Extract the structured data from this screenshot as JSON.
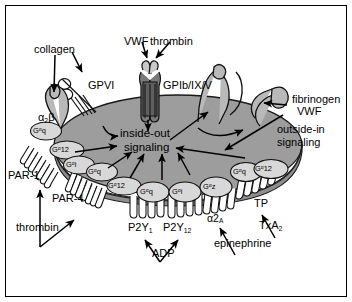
{
  "figure": {
    "type": "biological-schematic",
    "frame_color": "#000000",
    "cell_fill": "#9d9d9d",
    "cell_stroke": "#1a1a1a",
    "receptor_fill": "#c9c9c9",
    "gprotein_fill": "#d8d8d8",
    "background": "#ffffff"
  },
  "center": {
    "line1": "inside-out",
    "line2": "signaling"
  },
  "outside_in": {
    "line1": "outside-in",
    "line2": "signaling"
  },
  "receptors": {
    "gpvi": "GPVI",
    "gpib": "GPIb/IX/V",
    "par1": "PAR-1",
    "par4": "PAR-4",
    "p2y1_base": "P2Y",
    "p2y1_sub": "1",
    "p2y12_base": "P2Y",
    "p2y12_sub": "12",
    "alpha2a_base": "α2",
    "alpha2a_sub": "A",
    "tp": "TP",
    "integrin_collagen_base": "α",
    "integrin_collagen_sub": "2",
    "integrin_collagen_tail": "β"
  },
  "ligands": {
    "collagen": "collagen",
    "vwf_top": "VWF",
    "thrombin_top": "thrombin",
    "thrombin_left": "thrombin",
    "fibrinogen": "fibrinogen",
    "vwf_right": "VWF",
    "adp": "ADP",
    "epinephrine": "epinephrine",
    "txa2_base": "TxA",
    "txa2_sub": "2"
  },
  "g_proteins": [
    {
      "id": "g-par1-q",
      "sup": "α",
      "pre": "G",
      "post": "q",
      "x": 33,
      "y": 126
    },
    {
      "id": "g-par1-12",
      "sup": "α",
      "pre": "G",
      "post": "12",
      "x": 52,
      "y": 145
    },
    {
      "id": "g-par1-i",
      "sup": "α",
      "pre": "G",
      "post": "i",
      "x": 66,
      "y": 160
    },
    {
      "id": "g-par4-q",
      "sup": "α",
      "pre": "G",
      "post": "q",
      "x": 88,
      "y": 167
    },
    {
      "id": "g-par4-12",
      "sup": "α",
      "pre": "G",
      "post": "12",
      "x": 108,
      "y": 181
    },
    {
      "id": "g-p2y1-q",
      "sup": "α",
      "pre": "G",
      "post": "q",
      "x": 140,
      "y": 187
    },
    {
      "id": "g-p2y12-i",
      "sup": "α",
      "pre": "G",
      "post": "i",
      "x": 172,
      "y": 187
    },
    {
      "id": "g-a2a-z",
      "sup": "α",
      "pre": "G",
      "post": "z",
      "x": 203,
      "y": 182
    },
    {
      "id": "g-tp-q",
      "sup": "α",
      "pre": "G",
      "post": "q",
      "x": 233,
      "y": 167
    },
    {
      "id": "g-tp-12",
      "sup": "α",
      "pre": "G",
      "post": "12",
      "x": 255,
      "y": 164
    }
  ]
}
